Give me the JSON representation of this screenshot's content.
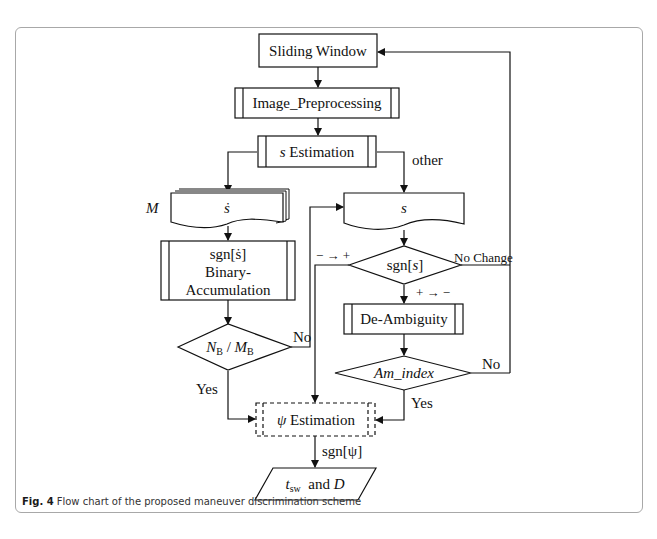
{
  "figure": {
    "caption_label": "Fig. 4",
    "caption_text": "Flow chart of the proposed maneuver discrimination scheme"
  },
  "nodes": {
    "sliding_window": "Sliding Window",
    "image_preprocessing": "Image_Preprocessing",
    "s_estimation_var": "s",
    "s_estimation_text": " Estimation",
    "multi_doc_label": "M",
    "multi_doc_var": "ṡ",
    "s_doc_var": "s",
    "binary_line1": "sgn[ṡ]",
    "binary_line2": "Binary-",
    "binary_line3": "Accumulation",
    "nb_mb_decision": "NB / MB",
    "nb_mb_N": "N",
    "nb_mb_sub": "B",
    "nb_mb_slash": " / ",
    "nb_mb_M": "M",
    "sgn_s_decision_prefix": "sgn[",
    "sgn_s_decision_var": "s",
    "sgn_s_decision_suffix": "]",
    "de_ambiguity": "De-Ambiguity",
    "am_index": "Am_index",
    "psi_estimation_var": "ψ",
    "psi_estimation_text": " Estimation",
    "output_t": "t",
    "output_sub": "sw",
    "output_rest": "  and ",
    "output_D": "D"
  },
  "edge_labels": {
    "other": "other",
    "no_left": "No",
    "yes_left": "Yes",
    "minus_to_plus": "− → +",
    "no_change": "No Change",
    "plus_to_minus": "+ → −",
    "no_right": "No",
    "yes_right": "Yes",
    "sgn_psi": "sgn[ψ]"
  }
}
